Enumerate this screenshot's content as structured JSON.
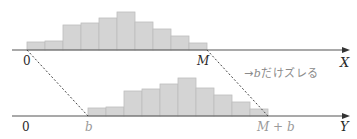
{
  "top_axis": {
    "name": "X",
    "origin_label": "0",
    "end_label": "M",
    "baseline_y": 50,
    "x_start": 27,
    "bar_width": 18,
    "bar_heights": [
      8,
      9,
      25,
      27,
      32,
      38,
      28,
      21,
      14,
      7
    ]
  },
  "bottom_axis": {
    "name": "Y",
    "origin_label": "0",
    "start_label": "b",
    "end_label": "M + b",
    "baseline_y": 116,
    "x_start": 88,
    "bar_width": 18,
    "bar_heights": [
      8,
      9,
      25,
      27,
      32,
      38,
      28,
      21,
      14,
      7
    ]
  },
  "annotation": {
    "arrow": "→",
    "shift_var": "b",
    "shift_text": "だけズレる"
  },
  "colors": {
    "bar_fill": "#d4d4d4",
    "bar_stroke": "#bdbdbd",
    "axis": "#555555",
    "dotted": "#444444"
  }
}
